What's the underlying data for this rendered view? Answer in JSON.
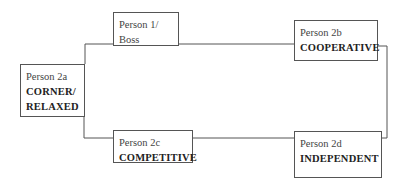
{
  "diagram": {
    "type": "organizational-flow",
    "nodes": [
      {
        "id": "p1",
        "name": "Person 1/",
        "trait": "Boss",
        "trait_bold": false
      },
      {
        "id": "p2a",
        "name": "Person 2a",
        "trait_lines": [
          "CORNER/",
          "RELAXED"
        ]
      },
      {
        "id": "p2b",
        "name": "Person 2b",
        "trait": "COOPERATIVE"
      },
      {
        "id": "p2c",
        "name": "Person 2c",
        "trait": "COMPETITIVE"
      },
      {
        "id": "p2d",
        "name": "Person 2d",
        "trait": "INDEPENDENT"
      }
    ],
    "edges": [
      [
        "p1",
        "p2a"
      ],
      [
        "p1",
        "p2b"
      ],
      [
        "p2a",
        "p2c"
      ],
      [
        "p2c",
        "p2d"
      ],
      [
        "p2b",
        "p2d"
      ]
    ],
    "colors": {
      "line": "#555555",
      "background": "#ffffff"
    }
  }
}
